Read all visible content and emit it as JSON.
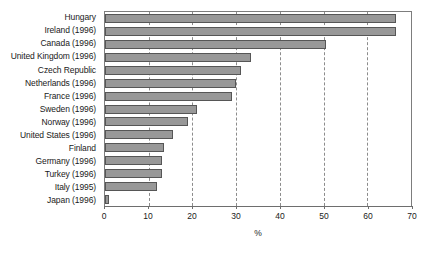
{
  "chart_data": {
    "type": "bar",
    "orientation": "horizontal",
    "title": "",
    "xlabel": "%",
    "ylabel": "",
    "xlim": [
      0,
      70
    ],
    "xticks": [
      0,
      10,
      20,
      30,
      40,
      50,
      60,
      70
    ],
    "xtick_labels": [
      "0",
      "10",
      "20",
      "30",
      "40",
      "50",
      "60",
      "70"
    ],
    "grid": true,
    "grid_axis": "x",
    "grid_style": "dashed",
    "legend": false,
    "bar_color": "#989898",
    "bar_edge_color": "#565656",
    "categories": [
      "Hungary",
      "Ireland (1996)",
      "Canada (1996)",
      "United Kingdom (1996)",
      "Czech Republic",
      "Netherlands (1996)",
      "France (1996)",
      "Sweden (1996)",
      "Norway (1996)",
      "United States (1996)",
      "Finland",
      "Germany (1996)",
      "Turkey (1996)",
      "Italy (1995)",
      "Japan (1996)"
    ],
    "values": [
      66.5,
      66.5,
      50.5,
      33.5,
      31,
      30,
      29,
      21,
      19,
      15.5,
      13.5,
      13,
      13,
      12,
      1
    ]
  }
}
